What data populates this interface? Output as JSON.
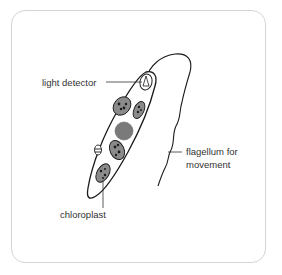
{
  "diagram": {
    "labels": {
      "light_detector": "light detector",
      "flagellum_line1": "flagellum for",
      "flagellum_line2": "movement",
      "chloroplast": "chloroplast"
    },
    "colors": {
      "outline": "#1a1a1a",
      "frame_border": "#d4d4d4",
      "chloroplast_fill": "#8a8a8a",
      "nucleus_fill": "#7a7a7a",
      "label_text": "#333333"
    }
  }
}
